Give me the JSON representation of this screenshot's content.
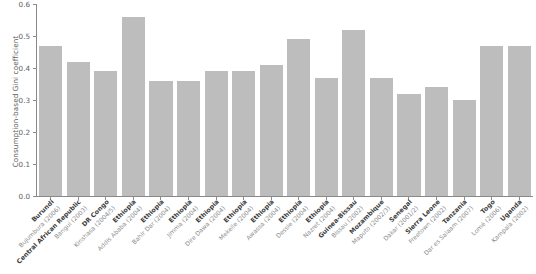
{
  "chart_data": {
    "type": "bar",
    "title": "",
    "xlabel": "",
    "ylabel": "Consumption-based Gini coefficient",
    "ylim": [
      0.0,
      0.6
    ],
    "ytick_labels": [
      "0.0",
      "0.1",
      "0.2",
      "0.3",
      "0.4",
      "0.5",
      "0.6"
    ],
    "ytick_values": [
      0.0,
      0.1,
      0.2,
      0.3,
      0.4,
      0.5,
      0.6
    ],
    "grid": false,
    "legend": null,
    "bar_color": "#bdbdbd",
    "axis_color": "#8a8a8a",
    "categories": [
      "Burundi",
      "Central African Republic",
      "DR Congo",
      "Ethiopia",
      "Ethiopia",
      "Ethiopia",
      "Ethiopia",
      "Ethiopia",
      "Ethiopia",
      "Ethiopia",
      "Ethiopia",
      "Guinea-Bissau",
      "Mozambique",
      "Senegal",
      "Sierra Leone",
      "Tanzania",
      "Togo",
      "Uganda"
    ],
    "sublabels": [
      "Bujumbura (2006)",
      "Bangui (2003)",
      "Kinshasa (2004/5)",
      "Addis Ababa (2004)",
      "Bahir Dar (2004)",
      "Jimma (2004)",
      "Dire Dawa (2004)",
      "Mekelle (2004)",
      "Awassa (2004)",
      "Dessie (2004)",
      "Nazret (2004)",
      "Bissau (2002)",
      "Maputo (2002/3)",
      "Dakar (2001/2)",
      "Freetown (2002)",
      "Dar es Salaam (2007)",
      "Lomé (2006)",
      "Kampala (2002)"
    ],
    "values": [
      0.47,
      0.42,
      0.39,
      0.56,
      0.36,
      0.36,
      0.39,
      0.39,
      0.41,
      0.49,
      0.37,
      0.52,
      0.37,
      0.32,
      0.34,
      0.3,
      0.47,
      0.47
    ]
  }
}
